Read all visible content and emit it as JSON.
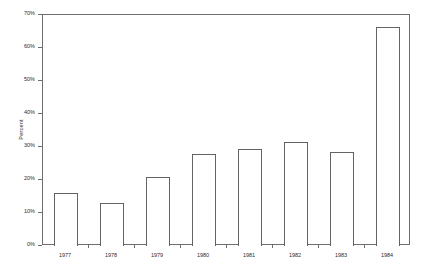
{
  "chart_data": {
    "type": "bar",
    "title": "",
    "xlabel": "",
    "ylabel": "Percent",
    "categories": [
      "1977",
      "1978",
      "1979",
      "1980",
      "1981",
      "1982",
      "1983",
      "1984"
    ],
    "values": [
      16,
      13,
      21,
      28,
      29.5,
      31.5,
      28.5,
      66.5
    ],
    "ylim": [
      0,
      70
    ],
    "ytick_values": [
      0,
      10,
      20,
      30,
      40,
      50,
      60,
      70
    ],
    "ytick_labels": [
      "0%",
      "10%",
      "20%",
      "30%",
      "40%",
      "50%",
      "60%",
      "70%"
    ],
    "grid": false,
    "legend": null,
    "bar_fill_color": "#ffffff",
    "bar_edge_color": "#636363",
    "axis_color": "#6e6e6e",
    "text_color": "#2b2b2b",
    "background_color": "#ffffff"
  }
}
